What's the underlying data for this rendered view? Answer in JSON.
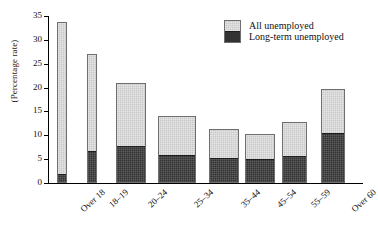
{
  "chart_data": {
    "type": "bar",
    "title": "",
    "subtitle": "",
    "xlabel": "",
    "ylabel": "(Percentage rate)",
    "ylim": [
      0,
      35
    ],
    "yticks": [
      0,
      5,
      10,
      15,
      20,
      25,
      30,
      35
    ],
    "grid": false,
    "stacked": true,
    "legend_position": "top-right",
    "categories": [
      "Over 18",
      "18–19",
      "20–24",
      "25–34",
      "35–44",
      "45–54",
      "55–59",
      "Over 60"
    ],
    "series": [
      {
        "name": "All unemployed",
        "color": "#c9c9c9",
        "values": [
          33.7,
          27.0,
          21.0,
          14.1,
          11.3,
          10.3,
          12.7,
          19.7
        ]
      },
      {
        "name": "Long-term unemployed",
        "color": "#333333",
        "values": [
          1.6,
          6.6,
          7.6,
          5.8,
          5.2,
          5.0,
          5.6,
          10.4
        ]
      }
    ]
  },
  "legend": {
    "items": [
      {
        "label": "All unemployed",
        "swatch": "light-gray-swatch"
      },
      {
        "label": "Long-term unemployed",
        "swatch": "dark-gray-swatch"
      }
    ]
  },
  "axes": {
    "y_title": "(Percentage rate)",
    "y_tick_labels": [
      "0",
      "5",
      "10",
      "15",
      "20",
      "25",
      "30",
      "35"
    ],
    "x_tick_labels": [
      "Over 18",
      "18–19",
      "20–24",
      "25–34",
      "35–44",
      "45–54",
      "55–59",
      "Over 60"
    ]
  },
  "colors": {
    "all_unemployed": "#c9c9c9",
    "long_term_unemployed": "#333333",
    "axis": "#000000",
    "background": "#ffffff"
  }
}
